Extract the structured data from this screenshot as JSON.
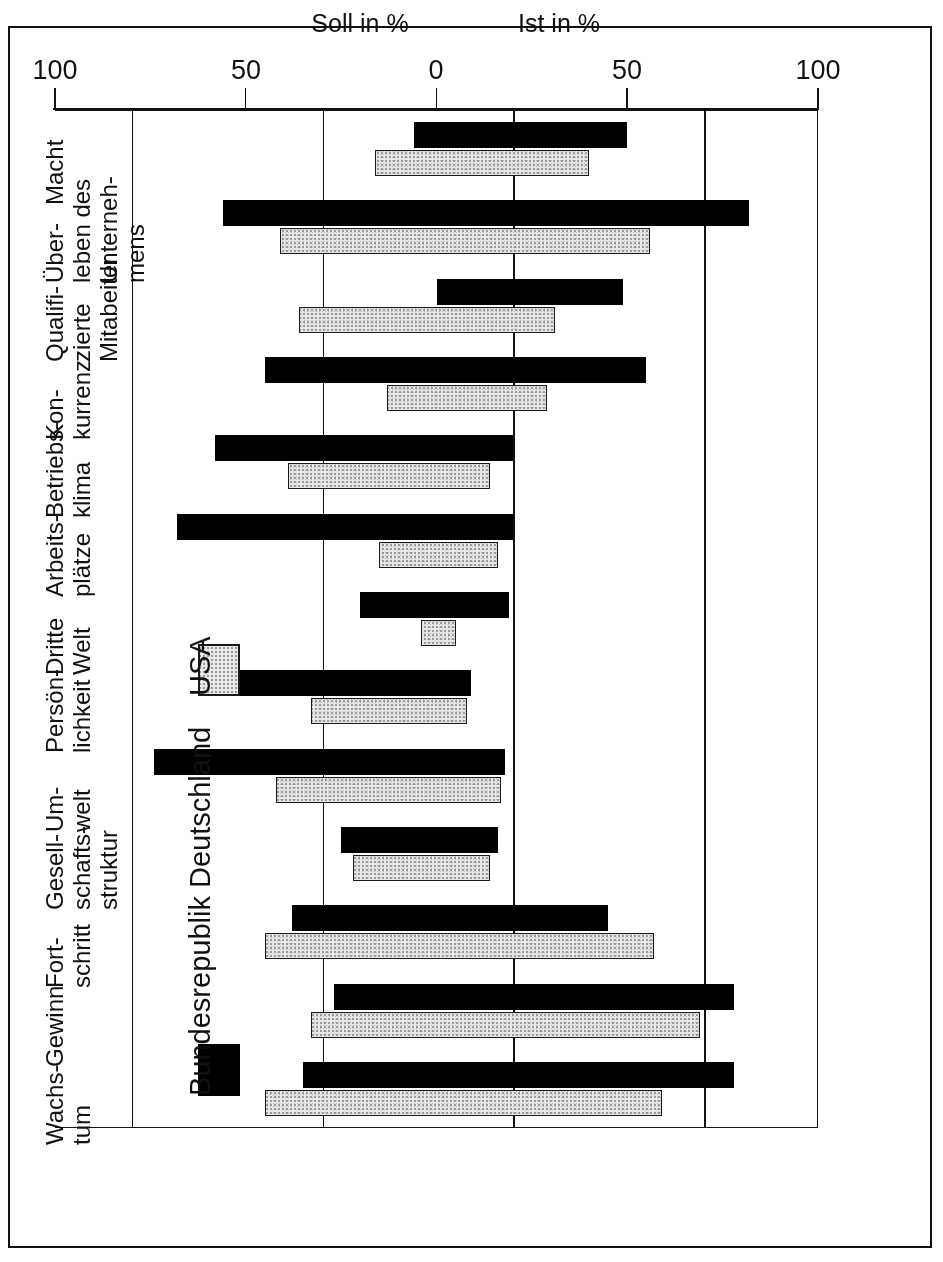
{
  "chart_data": {
    "type": "bar",
    "orientation": "horizontal-diverging",
    "title": "",
    "xlabel_left": "Ist in %",
    "xlabel_right": "Soll in %",
    "ylabel": "",
    "axis_ticks": [
      "100",
      "50",
      "0",
      "50",
      "100"
    ],
    "axis_tick_values": [
      -100,
      -50,
      0,
      50,
      100
    ],
    "xlim": [
      -100,
      100
    ],
    "grid": true,
    "legend_position": "upper-left",
    "legend": [
      {
        "name": "Bundesrepublik Deutschland",
        "color": "#000000",
        "pattern": "solid-black"
      },
      {
        "name": "USA",
        "color": "#e6e6e6",
        "pattern": "stippled-grey"
      }
    ],
    "categories": [
      "Wachs-\ntum",
      "Gewinn",
      "Fort-\nschritt",
      "Gesell-\nschafts-\nstruktur",
      "Um-\nwelt",
      "Persön-\nlichkeit",
      "Dritte\nWelt",
      "Arbeits-\nplätze",
      "Betriebs-\nklima",
      "Kon-\nkurrenz",
      "Qualifi-\nzierte\nMitabeiter",
      "Über-\nleben des\nUnterneh-\nmens",
      "Macht"
    ],
    "series": [
      {
        "name": "Bundesrepublik Deutschland",
        "ist": [
          78,
          78,
          45,
          16,
          18,
          9,
          19,
          20,
          20,
          55,
          49,
          82,
          50
        ],
        "soll": [
          35,
          27,
          38,
          25,
          74,
          60,
          20,
          68,
          58,
          45,
          0,
          56,
          6
        ]
      },
      {
        "name": "USA",
        "ist": [
          59,
          69,
          57,
          14,
          17,
          8,
          5,
          16,
          14,
          29,
          31,
          56,
          40
        ],
        "soll": [
          45,
          33,
          45,
          22,
          42,
          33,
          4,
          15,
          39,
          13,
          36,
          41,
          16
        ]
      }
    ]
  },
  "figure": {
    "axis_left_label": "Ist in %",
    "axis_right_label": "Soll in %"
  }
}
